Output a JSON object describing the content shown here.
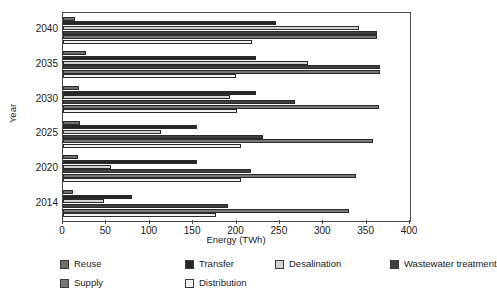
{
  "chart_data": {
    "type": "bar",
    "orientation": "horizontal",
    "title": "",
    "xlabel": "Energy (TWh)",
    "ylabel": "Year",
    "xlim": [
      0,
      400
    ],
    "xticks": [
      0,
      50,
      100,
      150,
      200,
      250,
      300,
      350,
      400
    ],
    "xtick_labels": [
      "0",
      "50",
      "100",
      "150",
      "200",
      "250",
      "300",
      "350",
      "400"
    ],
    "grid": false,
    "legend_position": "bottom",
    "categories": [
      "2040",
      "2035",
      "2030",
      "2025",
      "2020",
      "2014"
    ],
    "series": [
      {
        "name": "Reuse",
        "color": "#6e6e6e",
        "values": [
          14,
          26,
          19,
          20,
          17,
          11
        ]
      },
      {
        "name": "Transfer",
        "color": "#262626",
        "values": [
          245,
          222,
          223,
          154,
          154,
          80
        ]
      },
      {
        "name": "Desalination",
        "color": "#d4d4d4",
        "values": [
          341,
          282,
          193,
          113,
          55,
          47
        ]
      },
      {
        "name": "Wastewater treatment",
        "color": "#3f3f3f",
        "values": [
          362,
          365,
          267,
          231,
          217,
          190
        ]
      },
      {
        "name": "Supply",
        "color": "#777777",
        "values": [
          362,
          365,
          364,
          357,
          338,
          330
        ]
      },
      {
        "name": "Distribution",
        "color": "#f2f2f2",
        "values": [
          218,
          199,
          200,
          205,
          205,
          176
        ]
      }
    ]
  },
  "axes": {
    "ylabel": "Year",
    "xlabel": "Energy (TWh)",
    "ytick_labels": [
      "2040",
      "2035",
      "2030",
      "2025",
      "2020",
      "2014"
    ],
    "xtick_labels": [
      "0",
      "50",
      "100",
      "150",
      "200",
      "250",
      "300",
      "350",
      "400"
    ]
  },
  "legend": {
    "rows": [
      [
        {
          "label": "Reuse",
          "color": "#6e6e6e"
        },
        {
          "label": "Transfer",
          "color": "#262626"
        },
        {
          "label": "Desalination",
          "color": "#d4d4d4"
        },
        {
          "label": "Wastewater treatment",
          "color": "#3f3f3f"
        }
      ],
      [
        {
          "label": "Supply",
          "color": "#777777"
        },
        {
          "label": "Distribution",
          "color": "#f2f2f2"
        }
      ]
    ]
  },
  "colors": {
    "frame": "#4a4a4a",
    "text": "#1a1a1a",
    "background": "#ffffff"
  }
}
